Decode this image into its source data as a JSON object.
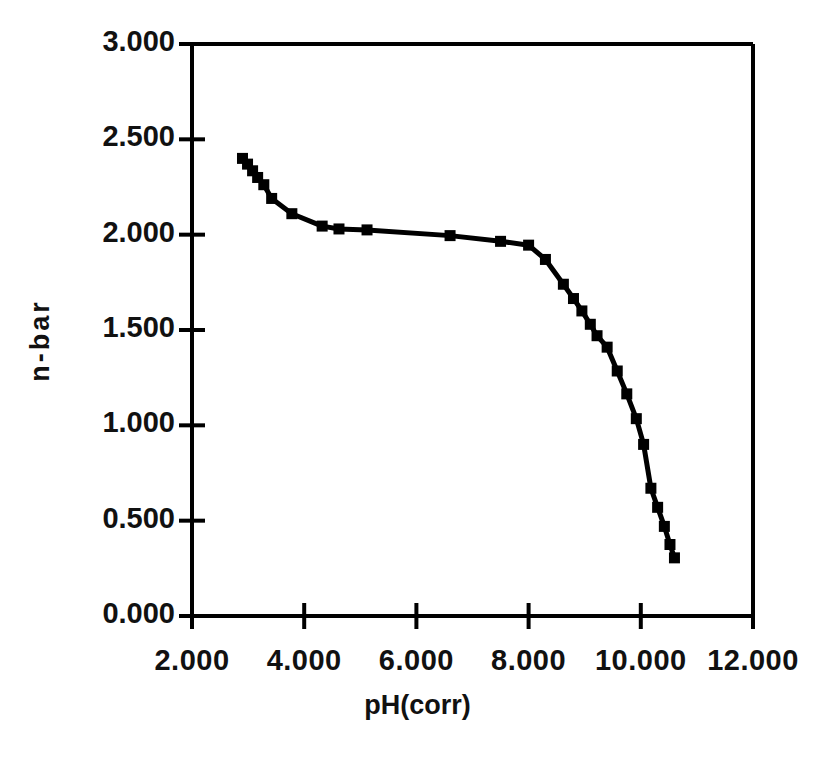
{
  "chart_data": {
    "type": "scatter",
    "title": "",
    "subtitle": "",
    "xlabel": "pH(corr)",
    "ylabel": "n-bar",
    "xlim": [
      2.0,
      12.0
    ],
    "ylim": [
      0.0,
      3.0
    ],
    "xticks": [
      2.0,
      4.0,
      6.0,
      8.0,
      10.0,
      12.0
    ],
    "yticks": [
      0.0,
      0.5,
      1.0,
      1.5,
      2.0,
      2.5,
      3.0
    ],
    "xtick_labels": [
      "2.000",
      "4.000",
      "6.000",
      "8.000",
      "10.000",
      "12.000"
    ],
    "ytick_labels": [
      "0.000",
      "0.500",
      "1.000",
      "1.500",
      "2.000",
      "2.500",
      "3.000"
    ],
    "grid": false,
    "legend": false,
    "legend_position": "none",
    "marker": "filled-square",
    "marker_color": "#000000",
    "line_color": "#000000",
    "line_style": "solid-connected",
    "series": [
      {
        "name": "n-bar",
        "x": [
          2.9,
          2.99,
          3.08,
          3.17,
          3.28,
          3.42,
          3.78,
          4.32,
          4.62,
          5.12,
          6.6,
          7.5,
          8.0,
          8.3,
          8.62,
          8.8,
          8.95,
          9.1,
          9.22,
          9.4,
          9.58,
          9.75,
          9.92,
          10.05,
          10.18,
          10.3,
          10.42,
          10.52
        ],
        "y": [
          2.4,
          2.37,
          2.335,
          2.3,
          2.262,
          2.19,
          2.11,
          2.045,
          2.03,
          2.025,
          1.995,
          1.965,
          1.945,
          1.87,
          1.74,
          1.665,
          1.6,
          1.53,
          1.47,
          1.41,
          1.285,
          1.165,
          1.035,
          0.9,
          0.67,
          0.57,
          0.47,
          0.375
        ],
        "marker_size": 11
      }
    ],
    "last_point": {
      "x": 10.6,
      "y": 0.305
    }
  }
}
